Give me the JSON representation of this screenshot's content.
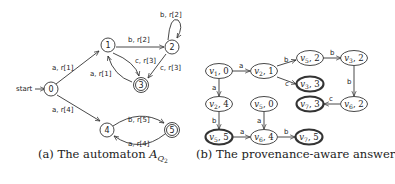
{
  "figure_a": {
    "caption_prefix": "(a) The automaton ",
    "caption_symbol": "A",
    "caption_subscript": "Q",
    "caption_subsubscript": "2",
    "start_label": "start",
    "states": [
      {
        "id": "0",
        "label": "0",
        "accepting": false
      },
      {
        "id": "1",
        "label": "1",
        "accepting": false
      },
      {
        "id": "2",
        "label": "2",
        "accepting": false
      },
      {
        "id": "3",
        "label": "3",
        "accepting": true
      },
      {
        "id": "4",
        "label": "4",
        "accepting": false
      },
      {
        "id": "5",
        "label": "5",
        "accepting": true
      }
    ],
    "edges": [
      {
        "from": "0",
        "to": "1",
        "label": "a, r[1]"
      },
      {
        "from": "0",
        "to": "4",
        "label": "a, r[4]"
      },
      {
        "from": "1",
        "to": "2",
        "label": "b, r[2]"
      },
      {
        "from": "1",
        "to": "3",
        "label": "c, r[3]"
      },
      {
        "from": "3",
        "to": "1",
        "label": "a, r[1]"
      },
      {
        "from": "2",
        "to": "2",
        "label": "b, r[2]"
      },
      {
        "from": "2",
        "to": "3",
        "label": "c, r[3]"
      },
      {
        "from": "4",
        "to": "5",
        "label": "b, r[5]"
      },
      {
        "from": "5",
        "to": "4",
        "label": "a, r[4]"
      }
    ]
  },
  "figure_b": {
    "caption": "(b) The provenance-aware answer",
    "nodes": [
      {
        "id": "v1_0",
        "var": "v",
        "sub": "1",
        "state": "0",
        "accepting": false
      },
      {
        "id": "v2_1",
        "var": "v",
        "sub": "2",
        "state": "1",
        "accepting": false
      },
      {
        "id": "v5_2",
        "var": "v",
        "sub": "5",
        "state": "2",
        "accepting": false
      },
      {
        "id": "v3_2",
        "var": "v",
        "sub": "3",
        "state": "2",
        "accepting": false
      },
      {
        "id": "v3_3",
        "var": "v",
        "sub": "3",
        "state": "3",
        "accepting": true
      },
      {
        "id": "v2_4",
        "var": "v",
        "sub": "2",
        "state": "4",
        "accepting": false
      },
      {
        "id": "v5_0",
        "var": "v",
        "sub": "5",
        "state": "0",
        "accepting": false
      },
      {
        "id": "v7_3",
        "var": "v",
        "sub": "7",
        "state": "3",
        "accepting": true
      },
      {
        "id": "v6_2",
        "var": "v",
        "sub": "6",
        "state": "2",
        "accepting": false
      },
      {
        "id": "v5_5",
        "var": "v",
        "sub": "5",
        "state": "5",
        "accepting": true
      },
      {
        "id": "v6_4",
        "var": "v",
        "sub": "6",
        "state": "4",
        "accepting": false
      },
      {
        "id": "v7_5",
        "var": "v",
        "sub": "7",
        "state": "5",
        "accepting": true
      }
    ],
    "edges": [
      {
        "from": "v1_0",
        "to": "v2_1",
        "label": "a"
      },
      {
        "from": "v2_1",
        "to": "v5_2",
        "label": "b"
      },
      {
        "from": "v2_1",
        "to": "v3_3",
        "label": "c"
      },
      {
        "from": "v5_2",
        "to": "v3_2",
        "label": "b"
      },
      {
        "from": "v3_2",
        "to": "v6_2",
        "label": "b"
      },
      {
        "from": "v6_2",
        "to": "v7_3",
        "label": "c"
      },
      {
        "from": "v1_0",
        "to": "v2_4",
        "label": "a"
      },
      {
        "from": "v2_4",
        "to": "v5_5",
        "label": "b"
      },
      {
        "from": "v5_0",
        "to": "v6_4",
        "label": "a"
      },
      {
        "from": "v5_5",
        "to": "v6_4",
        "label": "a"
      },
      {
        "from": "v6_4",
        "to": "v7_5",
        "label": "b"
      }
    ]
  }
}
